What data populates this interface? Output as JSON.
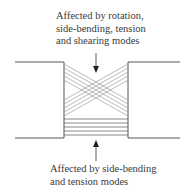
{
  "diagram": {
    "top_annotation": {
      "lines": [
        "Affected by rotation,",
        "side-bending, tension",
        "and shearing modes"
      ]
    },
    "bottom_annotation": {
      "lines": [
        "Affected by side-bending",
        "and tension modes"
      ]
    },
    "regions": {
      "upper": "crossed fibres (X pattern)",
      "lower": "parallel horizontal fibres"
    },
    "colors": {
      "line": "#333333",
      "fibre": "#8a8a8a",
      "text": "#3a3a3a"
    }
  }
}
